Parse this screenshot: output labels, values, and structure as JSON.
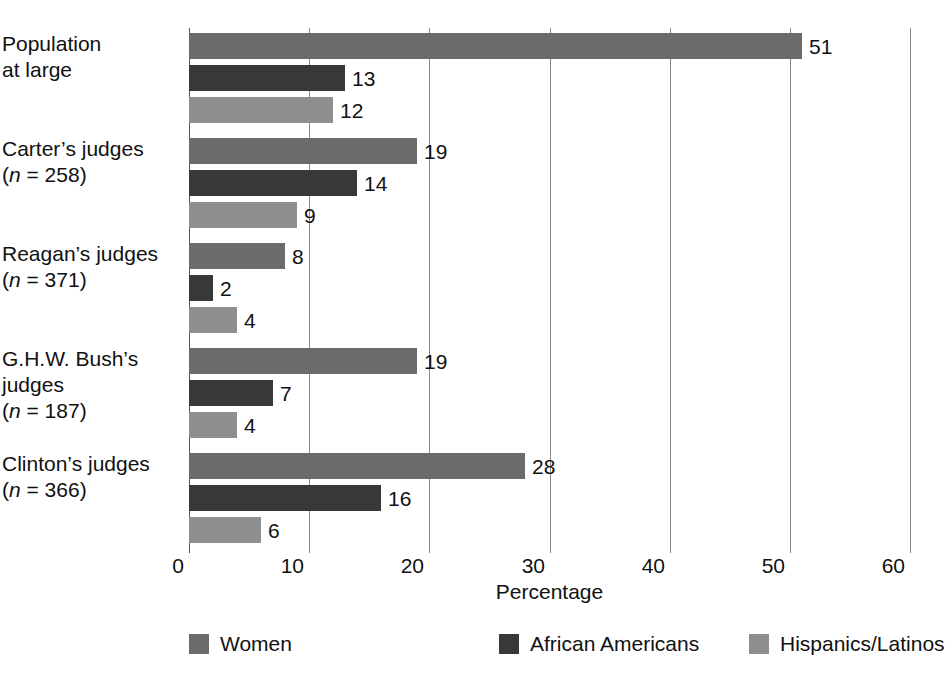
{
  "chart_data": {
    "type": "bar",
    "orientation": "horizontal",
    "title": "",
    "xlabel": "Percentage",
    "ylabel": "",
    "xlim": [
      0,
      60
    ],
    "xticks": [
      0,
      10,
      20,
      30,
      40,
      50,
      60
    ],
    "grid": true,
    "grid_axis": "x",
    "legend_position": "bottom",
    "value_labels": true,
    "categories": [
      "Population at large",
      "Carter's judges (n = 258)",
      "Reagan's judges (n = 371)",
      "G.H.W. Bush's judges (n = 187)",
      "Clinton's judges (n = 366)"
    ],
    "series": [
      {
        "name": "Women",
        "color": "#6b6b6b",
        "values": [
          51,
          19,
          8,
          19,
          28
        ]
      },
      {
        "name": "African Americans",
        "color": "#383838",
        "values": [
          13,
          14,
          2,
          7,
          16
        ]
      },
      {
        "name": "Hispanics/Latinos",
        "color": "#8f8f8f",
        "values": [
          12,
          9,
          4,
          4,
          6
        ]
      }
    ]
  },
  "category_labels": [
    {
      "lines": [
        "Population",
        "at large"
      ],
      "n": null
    },
    {
      "lines": [
        "Carter’s judges"
      ],
      "n": "258"
    },
    {
      "lines": [
        "Reagan’s judges"
      ],
      "n": "371"
    },
    {
      "lines": [
        "G.H.W. Bush’s",
        "judges"
      ],
      "n": "187"
    },
    {
      "lines": [
        "Clinton’s judges"
      ],
      "n": "366"
    }
  ],
  "axis": {
    "xlabel": "Percentage",
    "ticks": [
      "0",
      "10",
      "20",
      "30",
      "40",
      "50",
      "60"
    ]
  },
  "legend": {
    "items": [
      {
        "label": "Women",
        "color": "#6b6b6b"
      },
      {
        "label": "African Americans",
        "color": "#383838"
      },
      {
        "label": "Hispanics/Latinos",
        "color": "#8f8f8f"
      }
    ]
  },
  "value_labels": {
    "group_0": [
      "51",
      "13",
      "12"
    ],
    "group_1": [
      "19",
      "14",
      "9"
    ],
    "group_2": [
      "8",
      "2",
      "4"
    ],
    "group_3": [
      "19",
      "7",
      "4"
    ],
    "group_4": [
      "28",
      "16",
      "6"
    ]
  },
  "colors": {
    "women": "#6b6b6b",
    "african_americans": "#383838",
    "hispanics_latinos": "#8f8f8f",
    "gridline": "#8a8a8a",
    "text": "#111111",
    "background": "#ffffff"
  }
}
